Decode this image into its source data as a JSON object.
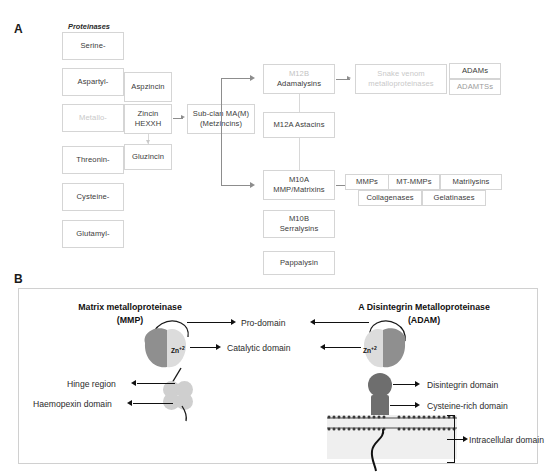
{
  "figure": {
    "panel_a_letter": "A",
    "panel_b_letter": "B"
  },
  "panel_a": {
    "header": "Proteinases",
    "proteinase_classes": [
      {
        "label": "Serine-",
        "faded": false
      },
      {
        "label": "Aspartyl-",
        "faded": false
      },
      {
        "label": "Metallo-",
        "faded": true
      },
      {
        "label": "Threonin-",
        "faded": false
      },
      {
        "label": "Cysteine-",
        "faded": false
      },
      {
        "label": "Glutamyl-",
        "faded": false
      }
    ],
    "zincin_group": [
      {
        "label": "Aspzincin"
      },
      {
        "line1": "Zincin",
        "line2": "HEXXH"
      },
      {
        "label": "Gluzincin"
      }
    ],
    "subclan": {
      "line1_a": "Sub-clan ",
      "line1_b": "MA(M)",
      "line2": "(Metzincins)"
    },
    "families": [
      {
        "line1": "M12B",
        "line2": "Adamalysins",
        "line1_faded": true
      },
      {
        "line1": "M12A Astacins",
        "line2": ""
      },
      {
        "line1": "M10A",
        "line2": "MMP/Matrixins",
        "line1_faded": false
      },
      {
        "line1": "M10B",
        "line2": "Serralysins",
        "line1_faded": false
      },
      {
        "line1": "Pappalysin",
        "line2": ""
      }
    ],
    "adamalysin_children": [
      {
        "line1": "Snake venom",
        "line2": "metalloproteinases",
        "faded": true
      },
      {
        "line1": "ADAMs",
        "line2": "ADAMTSs",
        "faded": false
      }
    ],
    "adams_label": "ADAMs",
    "adamtss_label": "ADAMTSs",
    "mmp_children_row1": [
      "MMPs",
      "MT-MMPs",
      "Matrilysins"
    ],
    "mmp_children_row2": [
      "Collagenases",
      "Gelatinases"
    ]
  },
  "panel_b": {
    "mmp_title_line1": "Matrix metalloproteinase",
    "mmp_title_line2": "(MMP)",
    "adam_title_line1": "A Disintegrin Metalloproteinase",
    "adam_title_line2": "(ADAM)",
    "zinc_label": "Zn",
    "zinc_charge": "+2",
    "center_labels": [
      "Pro-domain",
      "Catalytic domain"
    ],
    "mmp_labels": [
      "Hinge region",
      "Haemopexin domain"
    ],
    "adam_labels": [
      "Disintegrin domain",
      "Cysteine-rich domain",
      "Intracellular domain"
    ]
  },
  "colors": {
    "box_border": "#d5d5d5",
    "box_text": "#3a3a3a",
    "faded_text": "#c8c8c8",
    "connector": "#8d8d8d",
    "arrow_black": "#111111",
    "pro_domain": "#8f8f8f",
    "catalytic_domain": "#d9d9d9",
    "haemopexin": "#cfcfcf",
    "disintegrin": "#6e6e6e",
    "membrane": "#efefef"
  }
}
